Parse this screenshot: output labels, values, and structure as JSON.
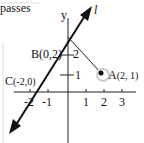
{
  "text_fragment": "passes",
  "axes": {
    "x_ticks": [
      "-2",
      "-1",
      "1",
      "2",
      "3"
    ],
    "y_ticks": [
      "1",
      "2"
    ],
    "y_label": "y"
  },
  "line": {
    "label": "l"
  },
  "points": {
    "A": {
      "name": "A",
      "coords": "(2, 1)"
    },
    "B": {
      "name": "B",
      "coords": "(0,2)"
    },
    "C": {
      "name": "C",
      "coords": "(-2,0)"
    }
  }
}
